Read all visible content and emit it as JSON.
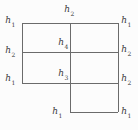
{
  "figure": {
    "type": "partitioned-rectangle-diagram",
    "background_color": "#fcfcfc",
    "line_color": "#6b6b6b",
    "label_color": "#3a3a3a",
    "geometry": {
      "main_rect": {
        "left": 22,
        "top": 23,
        "right": 118,
        "bottom": 83
      },
      "middle_vertical_x": 70,
      "row_divider_y": 52,
      "lower_cell": {
        "left": 70,
        "top": 83,
        "right": 118,
        "bottom": 112
      }
    },
    "labels": [
      {
        "base": "h",
        "sub": "1",
        "position": "top-left"
      },
      {
        "base": "h",
        "sub": "2",
        "position": "top-center"
      },
      {
        "base": "h",
        "sub": "1",
        "position": "top-right"
      },
      {
        "base": "h",
        "sub": "4",
        "position": "mid-center"
      },
      {
        "base": "h",
        "sub": "2",
        "position": "mid-left"
      },
      {
        "base": "h",
        "sub": "2",
        "position": "mid-right"
      },
      {
        "base": "h",
        "sub": "3",
        "position": "low-center"
      },
      {
        "base": "h",
        "sub": "1",
        "position": "low-left"
      },
      {
        "base": "h",
        "sub": "2",
        "position": "low-right"
      },
      {
        "base": "h",
        "sub": "1",
        "position": "bottom-center"
      },
      {
        "base": "h",
        "sub": "1",
        "position": "bottom-right"
      }
    ]
  }
}
